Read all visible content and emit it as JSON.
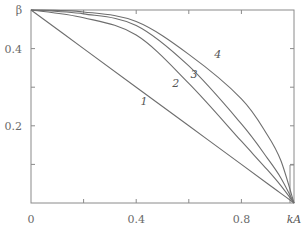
{
  "chart_data": {
    "type": "line",
    "title": "",
    "xlabel": "kA",
    "ylabel": "β",
    "xlim": [
      0,
      1.0
    ],
    "ylim": [
      0,
      0.5
    ],
    "grid": false,
    "legend": "none (curves labeled inline 1–4)",
    "x_ticks": [
      0,
      0.2,
      0.4,
      0.6,
      0.8,
      1.0
    ],
    "x_tick_labels": [
      "0",
      "",
      "0.4",
      "",
      "0.8",
      "kA"
    ],
    "y_ticks": [
      0.1,
      0.2,
      0.3,
      0.4,
      0.5
    ],
    "y_tick_labels": [
      "",
      "0.2",
      "",
      "0.4",
      "β"
    ],
    "x": [
      0,
      0.2,
      0.4,
      0.6,
      0.8,
      0.9,
      0.95,
      1.0
    ],
    "series": [
      {
        "name": "1",
        "values": [
          0.5,
          0.4,
          0.3,
          0.2,
          0.1,
          0.05,
          0.025,
          0.0
        ]
      },
      {
        "name": "2",
        "values": [
          0.5,
          0.48,
          0.435,
          0.31,
          0.16,
          0.085,
          0.045,
          0.0
        ]
      },
      {
        "name": "3",
        "values": [
          0.5,
          0.49,
          0.46,
          0.355,
          0.205,
          0.115,
          0.065,
          0.0
        ]
      },
      {
        "name": "4",
        "values": [
          0.5,
          0.495,
          0.47,
          0.385,
          0.27,
          0.175,
          0.11,
          0.0
        ]
      }
    ],
    "annotations": [
      {
        "text": "1",
        "x": 0.43,
        "y": 0.255
      },
      {
        "text": "2",
        "x": 0.55,
        "y": 0.3
      },
      {
        "text": "3",
        "x": 0.62,
        "y": 0.325
      },
      {
        "text": "4",
        "x": 0.71,
        "y": 0.375
      }
    ]
  },
  "axes": {
    "x_labels": [
      {
        "text": "0",
        "value": 0
      },
      {
        "text": "0.4",
        "value": 0.4
      },
      {
        "text": "0.8",
        "value": 0.8
      },
      {
        "text": "kA",
        "value": 1.0
      }
    ],
    "y_labels": [
      {
        "text": "0.2",
        "value": 0.2
      },
      {
        "text": "0.4",
        "value": 0.4
      },
      {
        "text": "β",
        "value": 0.5
      }
    ]
  }
}
